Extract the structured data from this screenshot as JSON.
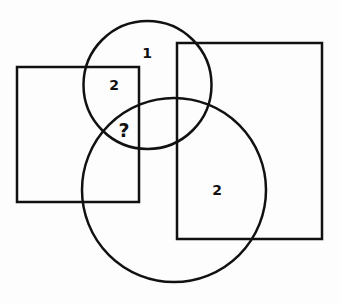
{
  "diagram": {
    "stroke_color": "#111111",
    "stroke_width": 2.5,
    "shapes": {
      "left_rect": {
        "x": 17,
        "y": 67,
        "width": 122,
        "height": 135
      },
      "right_rect": {
        "x": 177,
        "y": 43,
        "width": 145,
        "height": 196
      },
      "top_circle": {
        "cx": 147.5,
        "cy": 85,
        "r": 64
      },
      "big_circle": {
        "cx": 174,
        "cy": 190,
        "r": 92
      }
    },
    "labels": {
      "top_circle_only": "1",
      "left_rect_top_circle": "2",
      "unknown_region": "?",
      "right_rect_big_circle": "2"
    }
  }
}
